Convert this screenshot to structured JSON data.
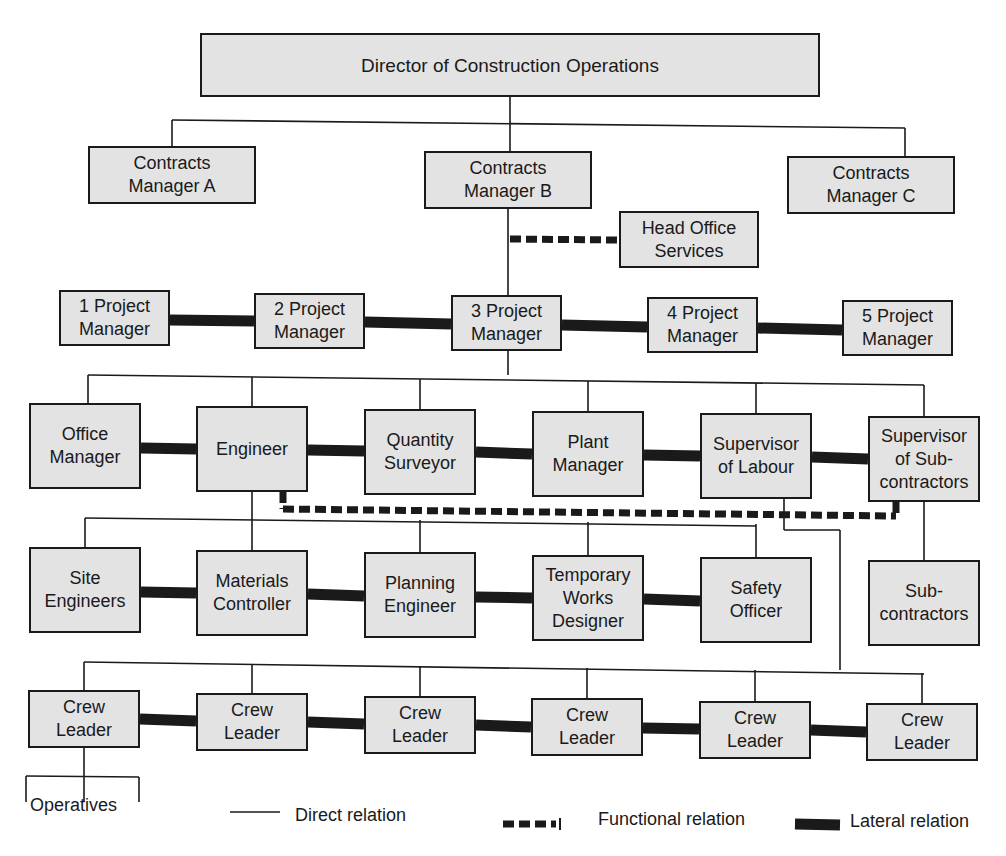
{
  "title": "Director of Construction Operations",
  "colors": {
    "box_fill": "#e3e3e3",
    "line": "#1a1a1a",
    "background": "#ffffff"
  },
  "nodes": {
    "director": {
      "label": "Director of Construction Operations",
      "x": 200,
      "y": 33,
      "w": 620,
      "h": 64
    },
    "cm_a": {
      "label": "Contracts\nManager A",
      "x": 88,
      "y": 146,
      "w": 168,
      "h": 58
    },
    "cm_b": {
      "label": "Contracts\nManager B",
      "x": 424,
      "y": 151,
      "w": 168,
      "h": 58
    },
    "cm_c": {
      "label": "Contracts\nManager C",
      "x": 787,
      "y": 156,
      "w": 168,
      "h": 58
    },
    "hos": {
      "label": "Head Office\nServices",
      "x": 619,
      "y": 211,
      "w": 140,
      "h": 57
    },
    "pm1": {
      "label": "1 Project\nManager",
      "x": 59,
      "y": 290,
      "w": 111,
      "h": 56
    },
    "pm2": {
      "label": "2 Project\nManager",
      "x": 254,
      "y": 293,
      "w": 111,
      "h": 56
    },
    "pm3": {
      "label": "3 Project\nManager",
      "x": 451,
      "y": 295,
      "w": 111,
      "h": 56
    },
    "pm4": {
      "label": "4 Project\nManager",
      "x": 647,
      "y": 297,
      "w": 111,
      "h": 56
    },
    "pm5": {
      "label": "5 Project\nManager",
      "x": 842,
      "y": 300,
      "w": 111,
      "h": 56
    },
    "office_mgr": {
      "label": "Office\nManager",
      "x": 29,
      "y": 403,
      "w": 112,
      "h": 86
    },
    "engineer": {
      "label": "Engineer",
      "x": 196,
      "y": 406,
      "w": 112,
      "h": 86
    },
    "qs": {
      "label": "Quantity\nSurveyor",
      "x": 364,
      "y": 409,
      "w": 112,
      "h": 86
    },
    "plant_mgr": {
      "label": "Plant\nManager",
      "x": 532,
      "y": 411,
      "w": 112,
      "h": 86
    },
    "sup_labour": {
      "label": "Supervisor\nof Labour",
      "x": 700,
      "y": 413,
      "w": 112,
      "h": 86
    },
    "sup_sub": {
      "label": "Supervisor\nof Sub-\ncontractors",
      "x": 868,
      "y": 416,
      "w": 112,
      "h": 86
    },
    "site_eng": {
      "label": "Site\nEngineers",
      "x": 29,
      "y": 547,
      "w": 112,
      "h": 86
    },
    "mat_ctrl": {
      "label": "Materials\nController",
      "x": 196,
      "y": 550,
      "w": 112,
      "h": 86
    },
    "plan_eng": {
      "label": "Planning\nEngineer",
      "x": 364,
      "y": 552,
      "w": 112,
      "h": 86
    },
    "tw_designer": {
      "label": "Temporary\nWorks\nDesigner",
      "x": 532,
      "y": 555,
      "w": 112,
      "h": 86
    },
    "safety": {
      "label": "Safety\nOfficer",
      "x": 700,
      "y": 557,
      "w": 112,
      "h": 86
    },
    "subcontractors": {
      "label": "Sub-\ncontractors",
      "x": 868,
      "y": 560,
      "w": 112,
      "h": 86
    },
    "crew1": {
      "label": "Crew\nLeader",
      "x": 28,
      "y": 690,
      "w": 112,
      "h": 58
    },
    "crew2": {
      "label": "Crew\nLeader",
      "x": 196,
      "y": 693,
      "w": 112,
      "h": 58
    },
    "crew3": {
      "label": "Crew\nLeader",
      "x": 364,
      "y": 696,
      "w": 112,
      "h": 58
    },
    "crew4": {
      "label": "Crew\nLeader",
      "x": 531,
      "y": 698,
      "w": 112,
      "h": 58
    },
    "crew5": {
      "label": "Crew\nLeader",
      "x": 699,
      "y": 701,
      "w": 112,
      "h": 58
    },
    "crew6": {
      "label": "Crew\nLeader",
      "x": 866,
      "y": 703,
      "w": 112,
      "h": 58
    }
  },
  "operatives": {
    "label": "Operatives",
    "x": 30,
    "y": 806
  },
  "legend": {
    "direct": {
      "label": "Direct relation",
      "x": 295,
      "y": 816
    },
    "functional": {
      "label": "Functional relation",
      "x": 598,
      "y": 820
    },
    "lateral": {
      "label": "Lateral relation",
      "x": 850,
      "y": 822
    }
  },
  "relations": {
    "direct": [
      [
        510,
        97,
        510,
        127
      ],
      [
        172,
        120,
        905,
        128
      ],
      [
        172,
        120,
        172,
        146
      ],
      [
        905,
        128,
        905,
        156
      ],
      [
        510,
        127,
        510,
        151
      ],
      [
        508,
        209,
        508,
        295
      ],
      [
        508,
        351,
        508,
        375
      ],
      [
        88,
        375,
        924,
        385
      ],
      [
        88,
        375,
        88,
        403
      ],
      [
        252,
        377,
        252,
        406
      ],
      [
        420,
        379,
        420,
        409
      ],
      [
        588,
        381,
        588,
        411
      ],
      [
        756,
        383,
        756,
        413
      ],
      [
        924,
        385,
        924,
        416
      ],
      [
        252,
        492,
        252,
        518
      ],
      [
        85,
        518,
        756,
        526
      ],
      [
        85,
        518,
        85,
        547
      ],
      [
        252,
        518,
        252,
        550
      ],
      [
        420,
        520,
        420,
        552
      ],
      [
        588,
        522,
        588,
        555
      ],
      [
        756,
        524,
        756,
        557
      ],
      [
        924,
        502,
        924,
        560
      ],
      [
        784,
        499,
        784,
        530
      ],
      [
        784,
        530,
        840,
        530
      ],
      [
        840,
        530,
        840,
        670
      ],
      [
        84,
        662,
        924,
        674
      ],
      [
        84,
        662,
        84,
        690
      ],
      [
        252,
        664,
        252,
        693
      ],
      [
        420,
        666,
        420,
        696
      ],
      [
        587,
        668,
        587,
        698
      ],
      [
        755,
        670,
        755,
        701
      ],
      [
        922,
        673,
        922,
        703
      ],
      [
        84,
        748,
        84,
        776
      ],
      [
        26,
        776,
        139,
        777
      ],
      [
        26,
        776,
        26,
        802
      ],
      [
        84,
        776,
        84,
        802
      ],
      [
        139,
        777,
        139,
        802
      ],
      [
        230,
        812,
        280,
        812
      ]
    ],
    "functional": [
      [
        510,
        239,
        619,
        240
      ],
      [
        283,
        492,
        283,
        509
      ],
      [
        283,
        509,
        896,
        516
      ],
      [
        896,
        502,
        896,
        516
      ],
      [
        503,
        824,
        556,
        824
      ]
    ],
    "lateral": [
      [
        170,
        320,
        254,
        321
      ],
      [
        365,
        322,
        451,
        324
      ],
      [
        562,
        325,
        647,
        327
      ],
      [
        758,
        328,
        842,
        330
      ],
      [
        141,
        448,
        196,
        449
      ],
      [
        308,
        450,
        364,
        451
      ],
      [
        476,
        452,
        532,
        454
      ],
      [
        644,
        455,
        700,
        456
      ],
      [
        812,
        457,
        868,
        459
      ],
      [
        141,
        592,
        196,
        593
      ],
      [
        308,
        594,
        364,
        596
      ],
      [
        476,
        597,
        532,
        598
      ],
      [
        644,
        599,
        700,
        601
      ],
      [
        140,
        719,
        196,
        721
      ],
      [
        308,
        722,
        364,
        724
      ],
      [
        476,
        725,
        531,
        727
      ],
      [
        643,
        728,
        699,
        729
      ],
      [
        811,
        730,
        866,
        732
      ],
      [
        795,
        824,
        840,
        825
      ]
    ]
  }
}
